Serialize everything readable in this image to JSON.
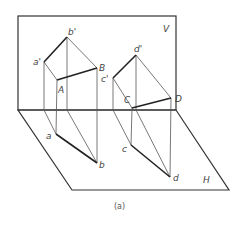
{
  "caption": "(a)",
  "planes": {
    "vertical": {
      "label": "V",
      "rect": [
        18,
        16,
        176,
        110
      ]
    },
    "horizontal": {
      "label": "H",
      "polygon": [
        [
          18,
          110
        ],
        [
          176,
          110
        ],
        [
          229,
          190
        ],
        [
          72,
          190
        ]
      ]
    }
  },
  "points": {
    "a_prime": {
      "label": "a'",
      "x": 44,
      "y": 62
    },
    "b_prime": {
      "label": "b'",
      "x": 67,
      "y": 37
    },
    "A": {
      "label": "A",
      "x": 57,
      "y": 80
    },
    "B": {
      "label": "B",
      "x": 97,
      "y": 68
    },
    "a": {
      "label": "a",
      "x": 56,
      "y": 134
    },
    "b": {
      "label": "b",
      "x": 97,
      "y": 163
    },
    "c_prime": {
      "label": "c'",
      "x": 113,
      "y": 78
    },
    "d_prime": {
      "label": "d'",
      "x": 136,
      "y": 55
    },
    "C": {
      "label": "C",
      "x": 132,
      "y": 108
    },
    "D": {
      "label": "D",
      "x": 171,
      "y": 98
    },
    "c": {
      "label": "c",
      "x": 131,
      "y": 145
    },
    "d": {
      "label": "d",
      "x": 170,
      "y": 177
    }
  },
  "colors": {
    "line": "#222222",
    "thin": "#555555",
    "label": "#444444"
  }
}
